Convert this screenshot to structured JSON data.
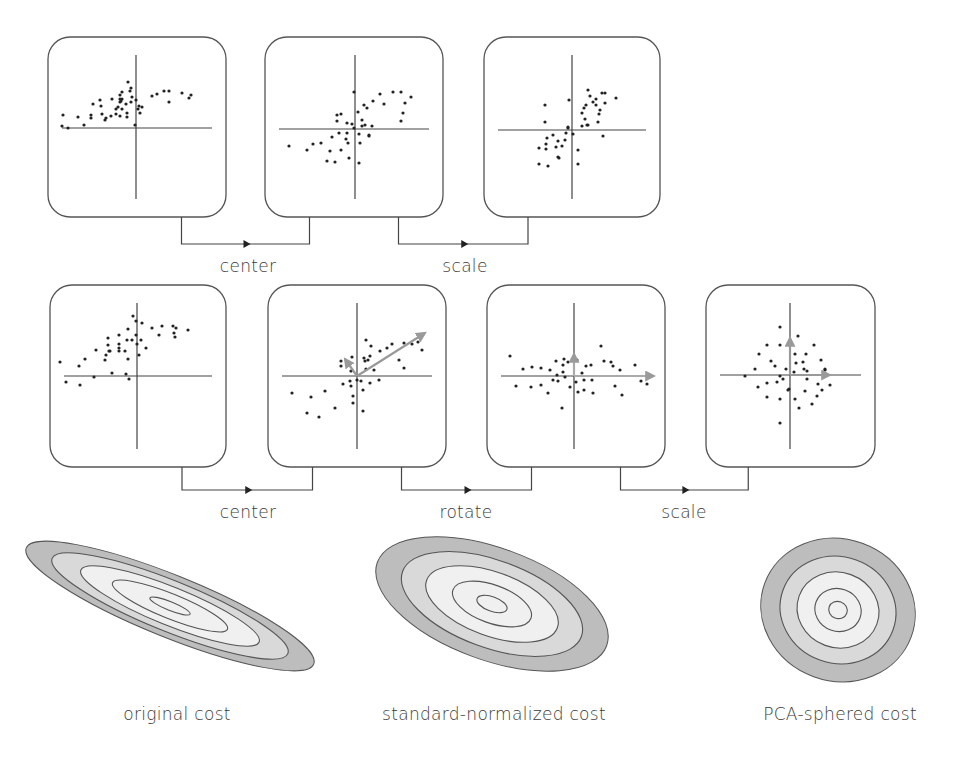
{
  "row1": {
    "steps": [
      {
        "label": "center",
        "from_box": 0,
        "to_box": 1
      },
      {
        "label": "scale",
        "from_box": 1,
        "to_box": 2
      }
    ],
    "boxes": [
      {
        "name": "original-data",
        "x": 48,
        "y": 37,
        "w": 178,
        "h": 180,
        "cx": 136,
        "cy": 128,
        "points": [
          [
            -43,
            -24
          ],
          [
            -35,
            -22
          ],
          [
            -34,
            -14
          ],
          [
            -31,
            -8
          ],
          [
            -24,
            -29
          ],
          [
            -6,
            -37
          ],
          [
            -1,
            -3
          ],
          [
            -9,
            -11
          ],
          [
            -16,
            -33
          ],
          [
            -16,
            -26
          ],
          [
            -20,
            -19
          ],
          [
            -20,
            -14
          ],
          [
            -14,
            -29
          ],
          [
            -14,
            -19
          ],
          [
            -10,
            -24
          ],
          [
            -9,
            -15
          ],
          [
            0,
            -28
          ],
          [
            -4,
            -31
          ],
          [
            2,
            -19
          ],
          [
            3,
            -22
          ],
          [
            -16,
            -12
          ],
          [
            -18,
            -21
          ],
          [
            -25,
            -12
          ],
          [
            -5,
            -26
          ],
          [
            4,
            -15
          ],
          [
            -45,
            -10
          ],
          [
            -58,
            -11
          ],
          [
            -52,
            -3
          ],
          [
            -73,
            -13
          ],
          [
            -68,
            0
          ],
          [
            -74,
            -2
          ],
          [
            -45,
            -13
          ],
          [
            -30,
            -10
          ],
          [
            -16,
            -29
          ],
          [
            -14,
            -36
          ],
          [
            -15,
            -27
          ],
          [
            -8,
            -46
          ],
          [
            -36,
            -28
          ],
          [
            -5,
            -40
          ],
          [
            6,
            -21
          ],
          [
            16,
            -32
          ],
          [
            21,
            -34
          ],
          [
            28,
            -37
          ],
          [
            33,
            -37
          ],
          [
            33,
            -26
          ],
          [
            46,
            -35
          ],
          [
            53,
            -30
          ],
          [
            55,
            -33
          ]
        ]
      },
      {
        "name": "centered-data",
        "x": 265,
        "y": 37,
        "w": 178,
        "h": 180,
        "cx": 355,
        "cy": 129,
        "points": [
          [
            -66,
            17
          ],
          [
            -48,
            21
          ],
          [
            -42,
            15
          ],
          [
            -34,
            14
          ],
          [
            -28,
            32
          ],
          [
            -20,
            33
          ],
          [
            -25,
            22
          ],
          [
            -14,
            21
          ],
          [
            -23,
            8
          ],
          [
            -16,
            4
          ],
          [
            -7,
            14
          ],
          [
            -9,
            10
          ],
          [
            -14,
            -15
          ],
          [
            -8,
            -6
          ],
          [
            -8,
            4
          ],
          [
            -1,
            -1
          ],
          [
            -3,
            -5
          ],
          [
            4,
            5
          ],
          [
            3,
            -17
          ],
          [
            7,
            -9
          ],
          [
            10,
            -4
          ],
          [
            7,
            -3
          ],
          [
            14,
            7
          ],
          [
            17,
            -3
          ],
          [
            9,
            -24
          ],
          [
            12,
            -21
          ],
          [
            18,
            -28
          ],
          [
            -18,
            -14
          ],
          [
            -18,
            -8
          ],
          [
            5,
            14
          ],
          [
            14,
            6
          ],
          [
            25,
            -35
          ],
          [
            29,
            -25
          ],
          [
            38,
            -37
          ],
          [
            46,
            -37
          ],
          [
            50,
            -26
          ],
          [
            48,
            -16
          ],
          [
            56,
            -32
          ],
          [
            46,
            -8
          ],
          [
            4,
            34
          ],
          [
            -6,
            29
          ],
          [
            -1,
            -37
          ]
        ]
      },
      {
        "name": "scaled-data",
        "x": 484,
        "y": 37,
        "w": 176,
        "h": 180,
        "cx": 572,
        "cy": 130,
        "points": [
          [
            -27,
            -25
          ],
          [
            -27,
            -8
          ],
          [
            -25,
            8
          ],
          [
            -26,
            14
          ],
          [
            -33,
            18
          ],
          [
            -26,
            19
          ],
          [
            -33,
            34
          ],
          [
            -24,
            36
          ],
          [
            -16,
            17
          ],
          [
            -14,
            11
          ],
          [
            -19,
            5
          ],
          [
            -10,
            16
          ],
          [
            -7,
            10
          ],
          [
            -6,
            3
          ],
          [
            -4,
            -2
          ],
          [
            -3,
            -30
          ],
          [
            -4,
            -3
          ],
          [
            1,
            4
          ],
          [
            6,
            20
          ],
          [
            6,
            34
          ],
          [
            10,
            -17
          ],
          [
            12,
            -22
          ],
          [
            13,
            -11
          ],
          [
            15,
            -5
          ],
          [
            14,
            -25
          ],
          [
            10,
            -4
          ],
          [
            16,
            -5
          ],
          [
            16,
            -40
          ],
          [
            18,
            -34
          ],
          [
            21,
            -28
          ],
          [
            24,
            -25
          ],
          [
            24,
            -31
          ],
          [
            27,
            -16
          ],
          [
            26,
            -8
          ],
          [
            28,
            -20
          ],
          [
            30,
            -37
          ],
          [
            33,
            -37
          ],
          [
            33,
            -27
          ],
          [
            31,
            6
          ],
          [
            44,
            -32
          ],
          [
            -14,
            27
          ],
          [
            -13,
            28
          ]
        ]
      }
    ]
  },
  "row2": {
    "steps": [
      {
        "label": "center",
        "from_box": 0,
        "to_box": 1
      },
      {
        "label": "rotate",
        "from_box": 1,
        "to_box": 2
      },
      {
        "label": "scale",
        "from_box": 2,
        "to_box": 3
      }
    ],
    "boxes": [
      {
        "name": "original-data",
        "x": 50,
        "y": 285,
        "w": 176,
        "h": 182,
        "cx": 137,
        "cy": 376,
        "points": [
          [
            -77,
            -14
          ],
          [
            -71,
            6
          ],
          [
            -58,
            -10
          ],
          [
            -57,
            9
          ],
          [
            -52,
            -17
          ],
          [
            -43,
            1
          ],
          [
            -41,
            -26
          ],
          [
            -32,
            -16
          ],
          [
            -31,
            -21
          ],
          [
            -29,
            -38
          ],
          [
            -29,
            -31
          ],
          [
            -28,
            -25
          ],
          [
            -25,
            -3
          ],
          [
            -27,
            -25
          ],
          [
            -18,
            -25
          ],
          [
            -18,
            -28
          ],
          [
            -18,
            -32
          ],
          [
            -18,
            -41
          ],
          [
            -12,
            -25
          ],
          [
            -9,
            -17
          ],
          [
            -9,
            -47
          ],
          [
            -10,
            -36
          ],
          [
            -5,
            -36
          ],
          [
            -4,
            -60
          ],
          [
            -8,
            3
          ],
          [
            -1,
            -41
          ],
          [
            0,
            -32
          ],
          [
            2,
            -21
          ],
          [
            5,
            -53
          ],
          [
            4,
            -36
          ],
          [
            9,
            -28
          ],
          [
            15,
            -48
          ],
          [
            22,
            -41
          ],
          [
            25,
            -50
          ],
          [
            36,
            -50
          ],
          [
            37,
            -43
          ],
          [
            39,
            -48
          ],
          [
            51,
            -46
          ],
          [
            38,
            -39
          ],
          [
            -1,
            -55
          ],
          [
            -11,
            -2
          ]
        ]
      },
      {
        "name": "centered-rotated-axes",
        "x": 268,
        "y": 285,
        "w": 178,
        "h": 182,
        "cx": 357,
        "cy": 376,
        "arrows": [
          {
            "dx": 68,
            "dy": -43,
            "color": "#999999"
          },
          {
            "dx": -12,
            "dy": -17,
            "color": "#999999"
          }
        ],
        "points": [
          [
            -65,
            17
          ],
          [
            -50,
            37
          ],
          [
            -38,
            41
          ],
          [
            -46,
            21
          ],
          [
            -32,
            15
          ],
          [
            -22,
            32
          ],
          [
            -14,
            8
          ],
          [
            -16,
            -10
          ],
          [
            -16,
            -15
          ],
          [
            -7,
            5
          ],
          [
            -6,
            -5
          ],
          [
            -6,
            10
          ],
          [
            -5,
            -19
          ],
          [
            -4,
            20
          ],
          [
            -4,
            27
          ],
          [
            0,
            4
          ],
          [
            7,
            -18
          ],
          [
            8,
            -15
          ],
          [
            11,
            -16
          ],
          [
            4,
            5
          ],
          [
            6,
            14
          ],
          [
            6,
            35
          ],
          [
            9,
            -7
          ],
          [
            9,
            -36
          ],
          [
            13,
            7
          ],
          [
            13,
            -20
          ],
          [
            14,
            -30
          ],
          [
            17,
            -6
          ],
          [
            22,
            4
          ],
          [
            23,
            -25
          ],
          [
            30,
            -28
          ],
          [
            35,
            -32
          ],
          [
            47,
            -33
          ],
          [
            42,
            -16
          ],
          [
            47,
            -8
          ],
          [
            55,
            -32
          ],
          [
            61,
            -34
          ],
          [
            65,
            -26
          ]
        ]
      },
      {
        "name": "rotated-data",
        "x": 487,
        "y": 285,
        "w": 178,
        "h": 182,
        "cx": 574,
        "cy": 376,
        "arrows": [
          {
            "dx": 80,
            "dy": 0,
            "color": "#aaaaaa"
          },
          {
            "dx": 0,
            "dy": -22,
            "color": "#aaaaaa"
          }
        ],
        "points": [
          [
            -64,
            -20
          ],
          [
            -58,
            10
          ],
          [
            -51,
            -7
          ],
          [
            -43,
            11
          ],
          [
            -42,
            -9
          ],
          [
            -33,
            -8
          ],
          [
            -33,
            9
          ],
          [
            -26,
            17
          ],
          [
            -24,
            -6
          ],
          [
            -21,
            4
          ],
          [
            -18,
            -15
          ],
          [
            -17,
            -1
          ],
          [
            -16,
            5
          ],
          [
            -11,
            -11
          ],
          [
            -12,
            32
          ],
          [
            -10,
            -17
          ],
          [
            -9,
            1
          ],
          [
            -11,
            -4
          ],
          [
            2,
            6
          ],
          [
            3,
            -16
          ],
          [
            4,
            16
          ],
          [
            8,
            -3
          ],
          [
            10,
            4
          ],
          [
            10,
            14
          ],
          [
            12,
            -10
          ],
          [
            17,
            -11
          ],
          [
            18,
            4
          ],
          [
            19,
            17
          ],
          [
            27,
            -30
          ],
          [
            30,
            -15
          ],
          [
            37,
            -14
          ],
          [
            39,
            -10
          ],
          [
            41,
            10
          ],
          [
            46,
            -6
          ],
          [
            48,
            19
          ],
          [
            61,
            -11
          ],
          [
            67,
            5
          ],
          [
            73,
            8
          ],
          [
            -6,
            -14
          ],
          [
            -4,
            11
          ]
        ]
      },
      {
        "name": "pca-sphered-data",
        "x": 706,
        "y": 285,
        "w": 169,
        "h": 182,
        "cx": 790,
        "cy": 375,
        "arrows": [
          {
            "dx": 40,
            "dy": 0,
            "color": "#999999"
          },
          {
            "dx": 0,
            "dy": -37,
            "color": "#999999"
          }
        ],
        "points": [
          [
            -45,
            1
          ],
          [
            -35,
            -6
          ],
          [
            -32,
            12
          ],
          [
            -31,
            -21
          ],
          [
            -23,
            -30
          ],
          [
            -23,
            8
          ],
          [
            -23,
            22
          ],
          [
            -19,
            -14
          ],
          [
            -15,
            -9
          ],
          [
            -13,
            7
          ],
          [
            -10,
            -30
          ],
          [
            -10,
            -48
          ],
          [
            -10,
            1
          ],
          [
            -10,
            24
          ],
          [
            -10,
            48
          ],
          [
            -7,
            4
          ],
          [
            -4,
            -6
          ],
          [
            -2,
            15
          ],
          [
            -1,
            14
          ],
          [
            4,
            -3
          ],
          [
            5,
            -21
          ],
          [
            5,
            24
          ],
          [
            6,
            -12
          ],
          [
            8,
            -39
          ],
          [
            9,
            33
          ],
          [
            13,
            -13
          ],
          [
            14,
            -6
          ],
          [
            15,
            16
          ],
          [
            16,
            -21
          ],
          [
            17,
            -4
          ],
          [
            17,
            4
          ],
          [
            22,
            29
          ],
          [
            24,
            -30
          ],
          [
            27,
            21
          ],
          [
            28,
            9
          ],
          [
            31,
            -15
          ],
          [
            32,
            15
          ],
          [
            35,
            -5
          ],
          [
            35,
            -6
          ],
          [
            40,
            10
          ]
        ]
      }
    ]
  },
  "costs": [
    {
      "label": "original cost",
      "cx": 170,
      "cy": 606,
      "rx": 155,
      "ry": 31,
      "angle": 22,
      "rings": [
        1.0,
        0.82,
        0.62,
        0.4,
        0.14
      ]
    },
    {
      "label": "standard-normalized cost",
      "cx": 492,
      "cy": 604,
      "rx": 122,
      "ry": 56,
      "angle": 20,
      "rings": [
        1.0,
        0.78,
        0.57,
        0.34,
        0.13
      ]
    },
    {
      "label": "PCA-sphered cost",
      "cx": 838,
      "cy": 610,
      "rx": 78,
      "ry": 71,
      "angle": 20,
      "rings": [
        1.0,
        0.75,
        0.53,
        0.3,
        0.12
      ]
    }
  ],
  "colors": {
    "box_stroke": "#555555",
    "point": "#222222",
    "axis": "#444444",
    "connector": "#444444",
    "cost_outer": "#bdbdbd",
    "cost_mid": "#d9d9d9",
    "cost_inner": "#f0f0f0",
    "cost_stroke": "#555555"
  }
}
